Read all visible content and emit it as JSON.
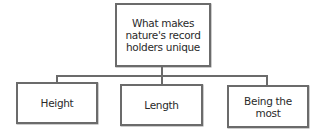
{
  "diagram": {
    "type": "hierarchy",
    "root": {
      "label": "What makes nature's record holders unique"
    },
    "children": [
      {
        "label": "Height"
      },
      {
        "label": "Length"
      },
      {
        "label": "Being the most"
      }
    ],
    "colors": {
      "border": "#6b6b6b",
      "text": "#2a2a2a",
      "background": "#ffffff"
    }
  }
}
